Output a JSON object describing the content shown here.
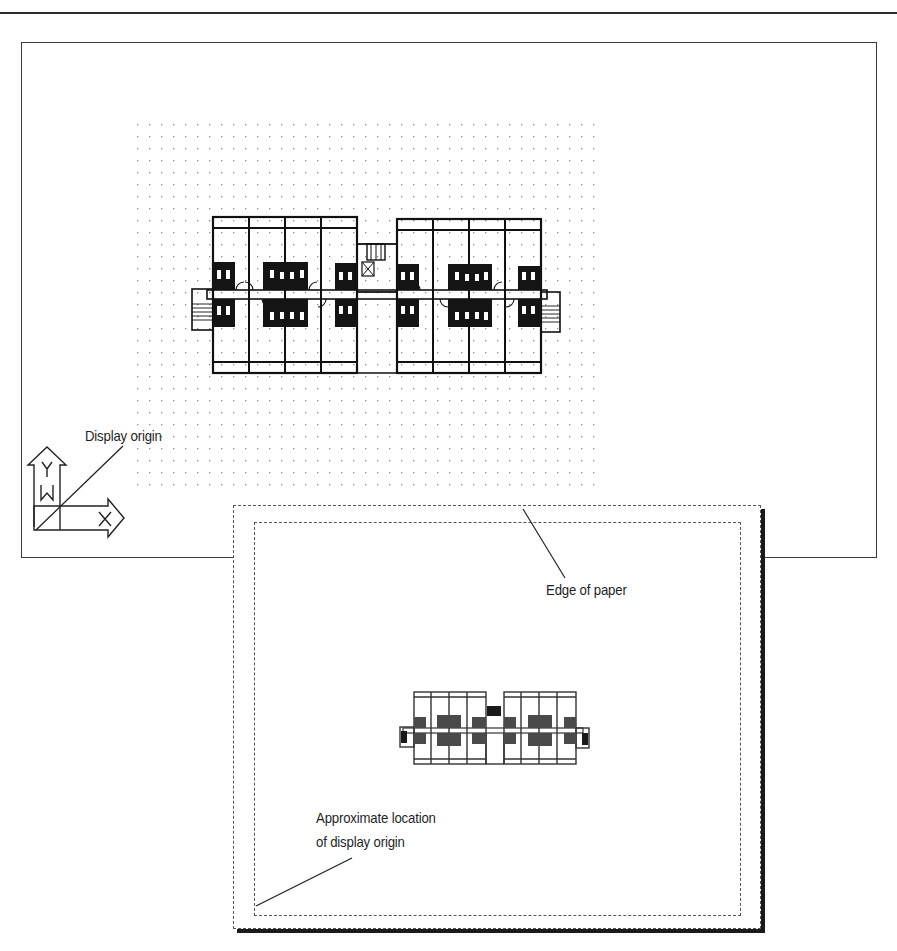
{
  "diagram": {
    "type": "cad-display-origin-illustration",
    "top_view": {
      "description": "Drawing window with grid and building floor plan",
      "grid": {
        "x_start": 137,
        "y_start": 124,
        "x_end": 603,
        "y_end": 486,
        "spacing": 12
      },
      "labels": {
        "display_origin": "Display origin"
      },
      "ucs_icon": {
        "y_axis_label": "Y",
        "x_axis_label": "X",
        "world_label": "W"
      }
    },
    "bottom_view": {
      "description": "Plotted paper sheet preview",
      "labels": {
        "edge_of_paper": "Edge of paper",
        "approx_line1": "Approximate location",
        "approx_line2": "of display origin"
      }
    },
    "colors": {
      "ink": "#1a1a1a",
      "grid_dot": "#8a8a8a",
      "background": "#ffffff"
    }
  }
}
